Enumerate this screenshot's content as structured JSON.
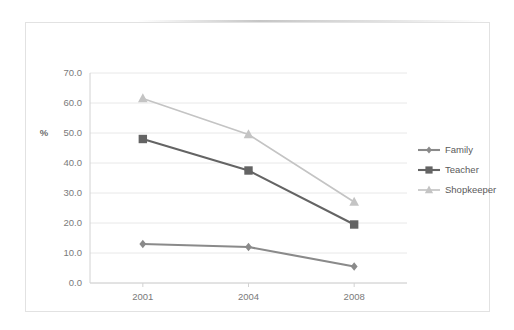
{
  "chart_data": {
    "type": "line",
    "title": "",
    "subtitle": "",
    "xlabel": "",
    "ylabel": "%",
    "categories": [
      "2001",
      "2004",
      "2008"
    ],
    "ylim": [
      0,
      70
    ],
    "ytick_step": 10,
    "ytick_labels": [
      "0.0",
      "10.0",
      "20.0",
      "30.0",
      "40.0",
      "50.0",
      "60.0",
      "70.0"
    ],
    "ytick_values": [
      0,
      10,
      20,
      30,
      40,
      50,
      60,
      70
    ],
    "grid": true,
    "grid_axis": "y",
    "legend_position": "right",
    "series": [
      {
        "name": "Family",
        "values": [
          13.0,
          12.0,
          5.5
        ],
        "marker": "diamond",
        "color": "#8a8a8a"
      },
      {
        "name": "Teacher",
        "values": [
          48.0,
          37.5,
          19.5
        ],
        "marker": "square",
        "color": "#646464"
      },
      {
        "name": "Shopkeeper",
        "values": [
          61.5,
          49.5,
          27.0
        ],
        "marker": "triangle",
        "color": "#c4c4c4"
      }
    ]
  },
  "colors": {
    "background": "#ffffff",
    "frame_border": "#e2e2e2",
    "gridline": "#e8e8e8",
    "axis_line": "#d2d2d2",
    "tick_text": "#7a7a7a",
    "legend_text": "#5a5a5a"
  },
  "legend": {
    "items": [
      {
        "label": "Family",
        "marker": "diamond-icon",
        "color": "#8a8a8a"
      },
      {
        "label": "Teacher",
        "marker": "square-icon",
        "color": "#646464"
      },
      {
        "label": "Shopkeeper",
        "marker": "triangle-icon",
        "color": "#c4c4c4"
      }
    ]
  },
  "axis": {
    "y_title": "%"
  }
}
